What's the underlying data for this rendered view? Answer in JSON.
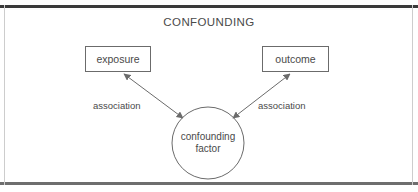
{
  "figure": {
    "title": "CONFOUNDING",
    "width": 418,
    "height": 192,
    "background": "#ffffff",
    "stroke_color": "#6b6b6b",
    "text_color": "#4a4a4a",
    "frame": {
      "top_rule_color": "#3a3a3a",
      "bottom_rule_color": "#6e6e6e",
      "side_rule_color": "#cdcdcd"
    }
  },
  "nodes": {
    "exposure": {
      "label": "exposure",
      "shape": "rectangle",
      "x": 85,
      "y": 46,
      "width": 66,
      "height": 26
    },
    "outcome": {
      "label": "outcome",
      "shape": "rectangle",
      "x": 262,
      "y": 46,
      "width": 67,
      "height": 26
    },
    "confounder": {
      "label_line1": "confounding",
      "label_line2": "factor",
      "shape": "circle",
      "cx": 208,
      "cy": 143,
      "r": 36
    }
  },
  "edges": [
    {
      "id": "assoc-left",
      "label": "association",
      "from": "confounder",
      "to": "exposure",
      "style": "double-headed-arrow"
    },
    {
      "id": "assoc-right",
      "label": "association",
      "from": "confounder",
      "to": "outcome",
      "style": "double-headed-arrow"
    }
  ]
}
